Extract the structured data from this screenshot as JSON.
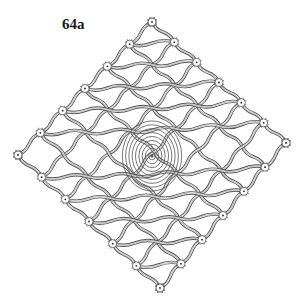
{
  "figure": {
    "label": "64a"
  },
  "diagram": {
    "shape": "diamond",
    "vertices": {
      "top": [
        152,
        22
      ],
      "right": [
        286,
        143
      ],
      "bottom": [
        160,
        288
      ],
      "left": [
        18,
        155
      ]
    },
    "center": [
      152,
      152
    ],
    "grid_divisions": 6,
    "spiral_rings": 9,
    "colors": {
      "thread": "#555555",
      "thread_fill": "#ffffff",
      "background": "#ffffff",
      "text": "#1a1a1a"
    }
  }
}
